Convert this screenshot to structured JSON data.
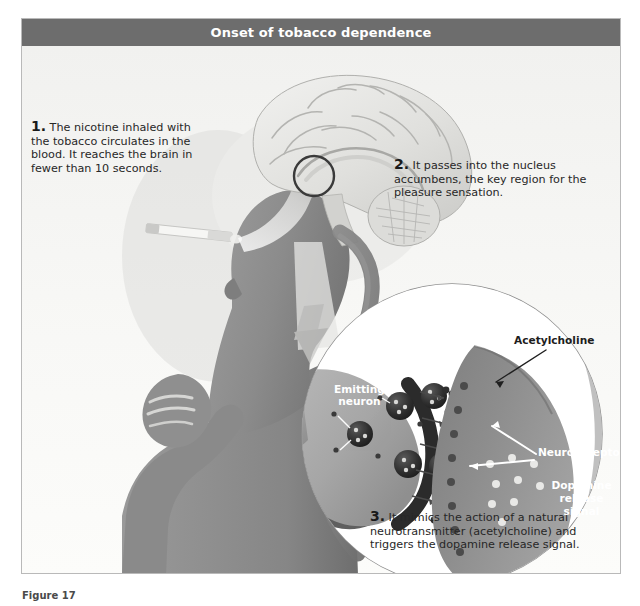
{
  "figure": {
    "title": "Onset of tobacco dependence",
    "caption": "Figure 17"
  },
  "steps": [
    {
      "number": "1.",
      "text": " The nicotine inhaled with the tobacco circulates in the blood. It reaches the brain in fewer than 10 seconds."
    },
    {
      "number": "2.",
      "text": " It passes into the nucleus accumbens, the key region for the pleasure sensation."
    },
    {
      "number": "3.",
      "text": " It mimics the action of a natural neurotransmitter (acetylcholine) and triggers the dopamine release signal."
    }
  ],
  "inset_labels": {
    "emitting_neuron": "Emitting\nneuron",
    "acetylcholine": "Acetylcholine",
    "neuroreceptors": "Neuroreceptors",
    "dopamine_release": "Dopamine\nrelease signal"
  },
  "colors": {
    "title_bar": "#6d6d6d",
    "panel_background": "#f7f7f5",
    "panel_border": "#b9b9b9",
    "silhouette": "#8d8d8d",
    "silhouette_dark": "#6f6f6f",
    "brain": "#e3e3e1",
    "vessel": "#7a7a7a",
    "emitting_neuron": "#a9a9a9",
    "receiving_neuron": "#8a8a8a",
    "vesicle": "#2f2f2f",
    "text": "#272727",
    "label_light": "#ffffff"
  }
}
